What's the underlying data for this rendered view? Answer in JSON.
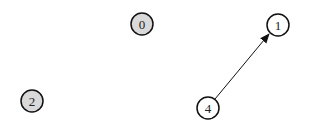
{
  "diagram": {
    "type": "directed-graph",
    "nodes": [
      {
        "id": "0",
        "label": "0",
        "x": 142,
        "y": 24,
        "fill": "#d9d9d9"
      },
      {
        "id": "1",
        "label": "1",
        "x": 278,
        "y": 25,
        "fill": "#ffffff"
      },
      {
        "id": "2",
        "label": "2",
        "x": 32,
        "y": 101,
        "fill": "#d9d9d9"
      },
      {
        "id": "4",
        "label": "4",
        "x": 208,
        "y": 108,
        "fill": "#ffffff"
      }
    ],
    "edges": [
      {
        "from": "4",
        "to": "1",
        "directed": true
      }
    ],
    "colors": {
      "stroke": "#111111",
      "highlight_fill": "#d9d9d9",
      "default_fill": "#ffffff"
    }
  }
}
